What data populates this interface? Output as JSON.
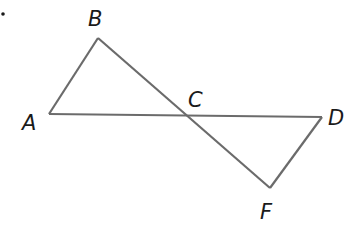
{
  "diagram": {
    "bullet": "•",
    "colors": {
      "line": "#6b6b6b",
      "text": "#1a1a1a",
      "background": "#ffffff"
    },
    "points": {
      "A": {
        "label": "A",
        "x": 49,
        "y": 114
      },
      "B": {
        "label": "B",
        "x": 98,
        "y": 38
      },
      "C": {
        "label": "C",
        "x": 187,
        "y": 116
      },
      "D": {
        "label": "D",
        "x": 322,
        "y": 117
      },
      "F": {
        "label": "F",
        "x": 270,
        "y": 188
      }
    },
    "segments": [
      "AB",
      "BF",
      "AD",
      "DF"
    ]
  }
}
